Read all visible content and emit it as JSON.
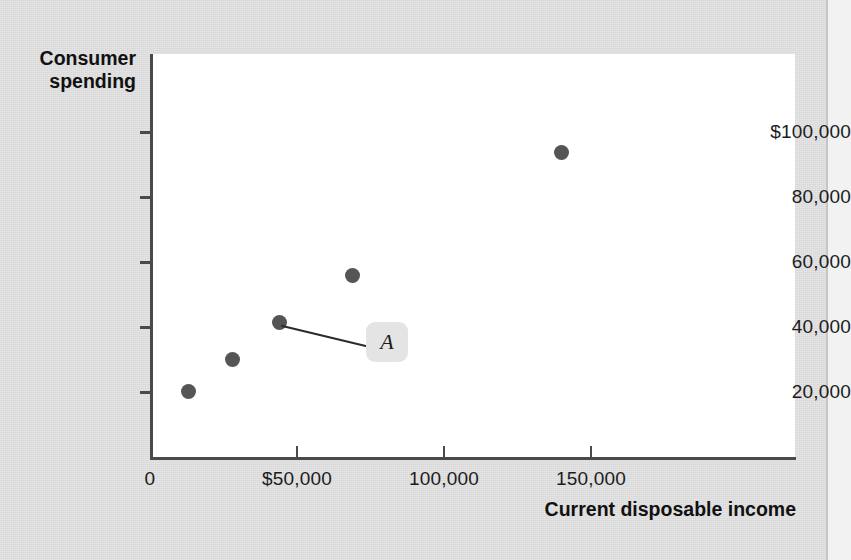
{
  "figure": {
    "background_color": "#dcdcdc",
    "plot_background_color": "#ffffff",
    "axis_color": "#4a4a4a",
    "marker_color": "#555555",
    "callout_box_color": "#e4e4e4"
  },
  "chart_data": {
    "type": "scatter",
    "title": "",
    "xlabel": "Current disposable income",
    "ylabel": "Consumer spending",
    "xlim": [
      0,
      170000
    ],
    "ylim": [
      0,
      110000
    ],
    "grid": false,
    "legend": null,
    "x_tick_labels": [
      "0",
      "$50,000",
      "100,000",
      "150,000"
    ],
    "x_tick_values": [
      0,
      50000,
      100000,
      150000
    ],
    "y_tick_labels": [
      "$100,000",
      "80,000",
      "60,000",
      "40,000",
      "20,000"
    ],
    "y_tick_values": [
      100000,
      80000,
      60000,
      40000,
      20000
    ],
    "points": [
      {
        "x": 13000,
        "y": 20300,
        "label": ""
      },
      {
        "x": 28000,
        "y": 30200,
        "label": ""
      },
      {
        "x": 44000,
        "y": 41400,
        "label": "A"
      },
      {
        "x": 69000,
        "y": 56000,
        "label": ""
      },
      {
        "x": 140000,
        "y": 94000,
        "label": ""
      }
    ],
    "annotations": [
      {
        "text": "A",
        "points_to_x": 44000,
        "points_to_y": 41400,
        "style": "rounded-gray-box-with-leader-line"
      }
    ]
  },
  "axis_titles": {
    "y_line_1": "Consumer",
    "y_line_2": "spending",
    "x": "Current disposable income"
  },
  "callout": {
    "label": "A"
  }
}
